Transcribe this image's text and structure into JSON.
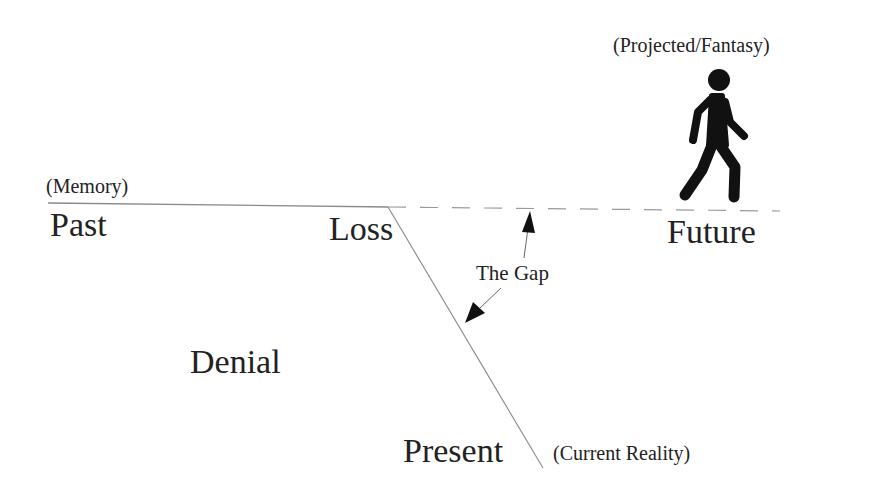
{
  "diagram": {
    "labels": {
      "memory": "(Memory)",
      "past": "Past",
      "loss": "Loss",
      "future": "Future",
      "projected": "(Projected/Fantasy)",
      "the_gap": "The Gap",
      "denial": "Denial",
      "present": "Present",
      "current_reality": "(Current Reality)"
    },
    "icons": {
      "walker": "walking-person-icon"
    },
    "colors": {
      "text": "#222222",
      "line": "#8a8a8a",
      "arrow": "#111111",
      "background": "#ffffff"
    }
  }
}
